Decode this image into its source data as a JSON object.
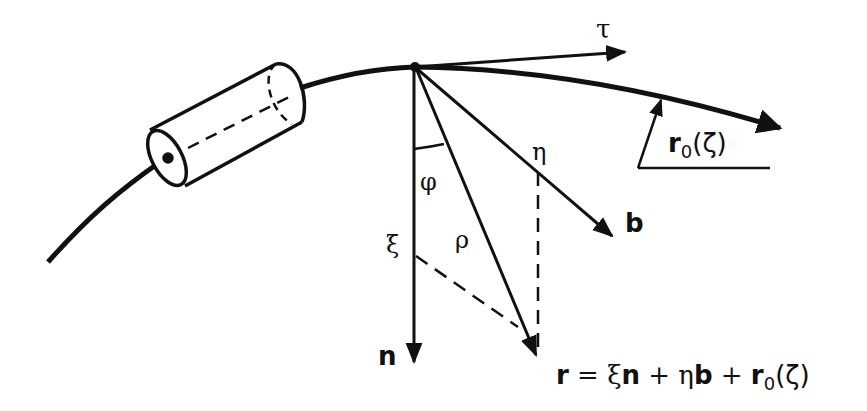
{
  "diagram": {
    "type": "vector-geometry",
    "elements": {
      "curve": "space curve with tangent direction",
      "cylinder": "cylindrical element on the curve",
      "vectors": [
        "tau",
        "n",
        "b",
        "rho",
        "r0(zeta)"
      ]
    },
    "labels": {
      "tau": "τ",
      "n": "n",
      "b": "b",
      "phi": "φ",
      "rho": "ρ",
      "xi": "ξ",
      "eta": "η",
      "r0_base": "r",
      "r0_sub": "0",
      "r0_arg": "(ζ)",
      "equation_r": "r",
      "equation_eq": " = ξ",
      "equation_n": "n",
      "equation_plus1": " + η",
      "equation_b": "b",
      "equation_plus2": " + ",
      "equation_r0": "r",
      "equation_sub": "0",
      "equation_arg": "(ζ)"
    },
    "colors": {
      "stroke": "#111111",
      "background": "#ffffff"
    }
  }
}
